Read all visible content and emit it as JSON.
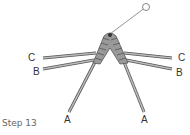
{
  "caption": "Step 13",
  "labels": {
    "left_c": "C",
    "left_b": "B",
    "left_a": "A",
    "right_c": "C",
    "right_b": "B",
    "right_a": "A"
  },
  "colors": {
    "strand": "#999999",
    "knot": "#888888",
    "outline": "#555555"
  }
}
